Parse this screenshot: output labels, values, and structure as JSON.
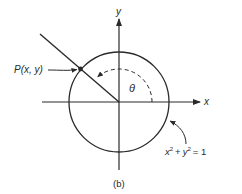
{
  "diagram": {
    "caption": "(b)",
    "axes": {
      "x_label": "x",
      "y_label": "y"
    },
    "point_label": "P(x, y)",
    "angle_label": "θ",
    "circle_equation": {
      "base_x": "x",
      "exp_x": "2",
      "plus": "+",
      "base_y": "y",
      "exp_y": "2",
      "equals": "= 1"
    },
    "colors": {
      "stroke": "#2a2a2a",
      "background": "#ffffff"
    }
  }
}
